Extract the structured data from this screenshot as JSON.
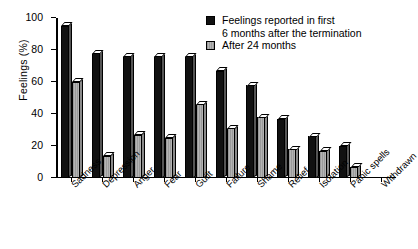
{
  "chart_data": {
    "type": "bar",
    "title": "",
    "xlabel": "",
    "ylabel": "Feelings (%)",
    "ylim": [
      0,
      100
    ],
    "yticks": [
      0,
      20,
      40,
      60,
      80,
      100
    ],
    "grid": false,
    "legend_position": "top-right",
    "categories": [
      "Sadness",
      "Depression",
      "Anger",
      "Fear",
      "Guilt",
      "Failure",
      "Shame",
      "Relief",
      "Isolation",
      "Panic spells",
      "Withdrawn"
    ],
    "series": [
      {
        "name": "Feelings reported in first 6 months after the termination",
        "legend_line_1": "Feelings reported in first",
        "legend_line_2": "6 months after the termination",
        "color": "#111111",
        "values": [
          95,
          78,
          76,
          76,
          76,
          67,
          58,
          37,
          26,
          20,
          0
        ]
      },
      {
        "name": "After 24 months",
        "legend_line_1": "After 24 months",
        "color": "#a8a8a8",
        "values": [
          60,
          14,
          27,
          25,
          46,
          31,
          38,
          18,
          17,
          7,
          0
        ]
      }
    ]
  }
}
